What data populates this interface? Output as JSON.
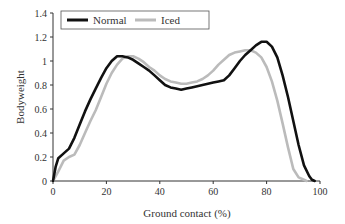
{
  "chart_data": {
    "type": "line",
    "title": "",
    "xlabel": "Ground contact (%)",
    "ylabel": "Bodyweight",
    "xlim": [
      0,
      100
    ],
    "ylim": [
      0,
      1.4
    ],
    "xticks": [
      0,
      20,
      40,
      60,
      80,
      100
    ],
    "yticks": [
      0,
      0.2,
      0.4,
      0.6,
      0.8,
      1,
      1.2,
      1.4
    ],
    "xtick_labels": [
      "0",
      "20",
      "40",
      "60",
      "80",
      "100"
    ],
    "ytick_labels": [
      "0",
      "0.2",
      "0.4",
      "0.6",
      "0.8",
      "1",
      "1.2",
      "1.4"
    ],
    "grid": false,
    "legend_position": "top-left inside",
    "series": [
      {
        "name": "Normal",
        "color": "#111111",
        "x": [
          0,
          1,
          2,
          4,
          6,
          8,
          10,
          12,
          14,
          16,
          18,
          20,
          22,
          24,
          26,
          28,
          30,
          32,
          34,
          36,
          38,
          40,
          42,
          44,
          46,
          48,
          50,
          52,
          54,
          56,
          58,
          60,
          62,
          64,
          66,
          68,
          70,
          72,
          74,
          76,
          78,
          80,
          82,
          84,
          86,
          88,
          90,
          92,
          94,
          96,
          97,
          98
        ],
        "y": [
          0,
          0.12,
          0.19,
          0.23,
          0.27,
          0.36,
          0.47,
          0.58,
          0.68,
          0.77,
          0.86,
          0.94,
          1.0,
          1.04,
          1.04,
          1.03,
          1.01,
          0.98,
          0.95,
          0.92,
          0.88,
          0.84,
          0.8,
          0.78,
          0.77,
          0.76,
          0.77,
          0.78,
          0.79,
          0.8,
          0.81,
          0.82,
          0.83,
          0.84,
          0.88,
          0.94,
          1.0,
          1.05,
          1.09,
          1.13,
          1.16,
          1.16,
          1.12,
          1.03,
          0.88,
          0.7,
          0.5,
          0.3,
          0.13,
          0.04,
          0.01,
          0
        ]
      },
      {
        "name": "Iced",
        "color": "#bbbbbb",
        "x": [
          0,
          2,
          4,
          6,
          8,
          10,
          12,
          14,
          16,
          18,
          20,
          22,
          24,
          26,
          28,
          30,
          32,
          34,
          36,
          38,
          40,
          42,
          44,
          46,
          48,
          50,
          52,
          54,
          56,
          58,
          60,
          62,
          64,
          66,
          68,
          70,
          72,
          74,
          76,
          78,
          80,
          82,
          84,
          86,
          88,
          90,
          92,
          94,
          95
        ],
        "y": [
          0,
          0.08,
          0.17,
          0.2,
          0.22,
          0.3,
          0.4,
          0.5,
          0.59,
          0.7,
          0.81,
          0.9,
          0.97,
          1.02,
          1.04,
          1.04,
          1.02,
          0.99,
          0.95,
          0.92,
          0.88,
          0.85,
          0.83,
          0.82,
          0.81,
          0.81,
          0.82,
          0.83,
          0.85,
          0.88,
          0.92,
          0.97,
          1.01,
          1.05,
          1.07,
          1.08,
          1.09,
          1.09,
          1.07,
          1.03,
          0.95,
          0.83,
          0.67,
          0.48,
          0.28,
          0.1,
          0.03,
          0.01,
          0
        ]
      }
    ]
  },
  "legend": {
    "items": [
      {
        "label": "Normal",
        "color": "#111111"
      },
      {
        "label": "Iced",
        "color": "#bbbbbb"
      }
    ]
  }
}
